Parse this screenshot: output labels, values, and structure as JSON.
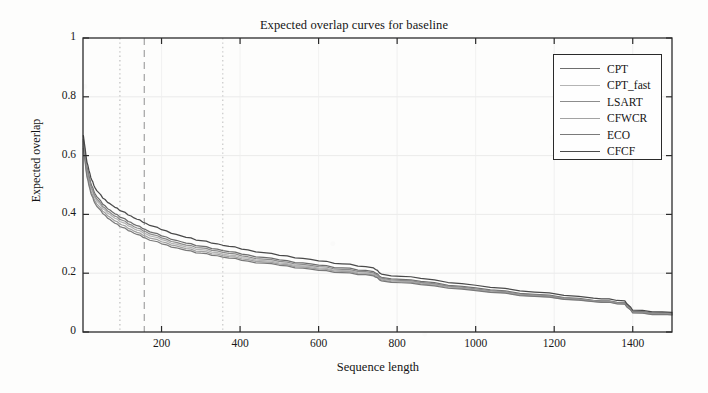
{
  "chart_data": {
    "type": "line",
    "title": "Expected overlap curves for baseline",
    "xlabel": "Sequence length",
    "ylabel": "Expected overlap",
    "xlim": [
      0,
      1500
    ],
    "ylim": [
      0,
      1
    ],
    "xticks": [
      200,
      400,
      600,
      800,
      1000,
      1200,
      1400
    ],
    "yticks": [
      "0",
      "0.2",
      "0.4",
      "0.6",
      "0.8",
      "1"
    ],
    "grid": "horizontal-and-vertical-faint",
    "legend_position": "top-right",
    "vertical_markers": [
      {
        "x": 94,
        "style": "dotted",
        "color": "#b8b8b8"
      },
      {
        "x": 156,
        "style": "dashed",
        "color": "#9a9a9a"
      },
      {
        "x": 356,
        "style": "dotted",
        "color": "#c2c2c2"
      }
    ],
    "x": [
      1,
      10,
      20,
      30,
      50,
      75,
      100,
      130,
      160,
      200,
      250,
      300,
      356,
      420,
      500,
      580,
      660,
      740,
      760,
      860,
      1000,
      1150,
      1300,
      1380,
      1400,
      1500
    ],
    "series": [
      {
        "name": "CPT",
        "color": "#6e6e6e",
        "values": [
          0.655,
          0.56,
          0.505,
          0.472,
          0.435,
          0.408,
          0.388,
          0.366,
          0.348,
          0.327,
          0.307,
          0.292,
          0.277,
          0.262,
          0.245,
          0.232,
          0.218,
          0.205,
          0.186,
          0.172,
          0.15,
          0.128,
          0.108,
          0.1,
          0.07,
          0.063
        ]
      },
      {
        "name": "CPT_fast",
        "color": "#b4b4b4",
        "values": [
          0.64,
          0.545,
          0.49,
          0.457,
          0.42,
          0.393,
          0.373,
          0.351,
          0.334,
          0.314,
          0.294,
          0.28,
          0.265,
          0.251,
          0.235,
          0.222,
          0.209,
          0.197,
          0.18,
          0.166,
          0.145,
          0.124,
          0.105,
          0.097,
          0.067,
          0.06
        ]
      },
      {
        "name": "LSART",
        "color": "#8c8c8c",
        "values": [
          0.648,
          0.552,
          0.497,
          0.464,
          0.427,
          0.4,
          0.38,
          0.358,
          0.341,
          0.32,
          0.3,
          0.286,
          0.271,
          0.256,
          0.24,
          0.227,
          0.213,
          0.201,
          0.183,
          0.169,
          0.147,
          0.126,
          0.106,
          0.098,
          0.068,
          0.061
        ]
      },
      {
        "name": "CFWCR",
        "color": "#a2a2a2",
        "values": [
          0.632,
          0.535,
          0.48,
          0.447,
          0.411,
          0.384,
          0.364,
          0.343,
          0.326,
          0.307,
          0.288,
          0.274,
          0.26,
          0.246,
          0.231,
          0.218,
          0.206,
          0.194,
          0.177,
          0.164,
          0.143,
          0.122,
          0.104,
          0.096,
          0.066,
          0.059
        ]
      },
      {
        "name": "ECO",
        "color": "#7a7a7a",
        "values": [
          0.625,
          0.528,
          0.472,
          0.439,
          0.403,
          0.376,
          0.356,
          0.336,
          0.319,
          0.3,
          0.282,
          0.268,
          0.255,
          0.241,
          0.227,
          0.214,
          0.202,
          0.191,
          0.174,
          0.161,
          0.141,
          0.121,
          0.103,
          0.095,
          0.065,
          0.058
        ]
      },
      {
        "name": "CFCF",
        "color": "#4a4a4a",
        "values": [
          0.668,
          0.578,
          0.525,
          0.492,
          0.456,
          0.43,
          0.41,
          0.388,
          0.37,
          0.348,
          0.327,
          0.311,
          0.295,
          0.279,
          0.261,
          0.247,
          0.232,
          0.218,
          0.197,
          0.182,
          0.159,
          0.136,
          0.115,
          0.106,
          0.074,
          0.067
        ]
      }
    ]
  },
  "legend": {
    "items": [
      {
        "label": "CPT"
      },
      {
        "label": "CPT_fast"
      },
      {
        "label": "LSART"
      },
      {
        "label": "CFWCR"
      },
      {
        "label": "ECO"
      },
      {
        "label": "CFCF"
      }
    ]
  }
}
